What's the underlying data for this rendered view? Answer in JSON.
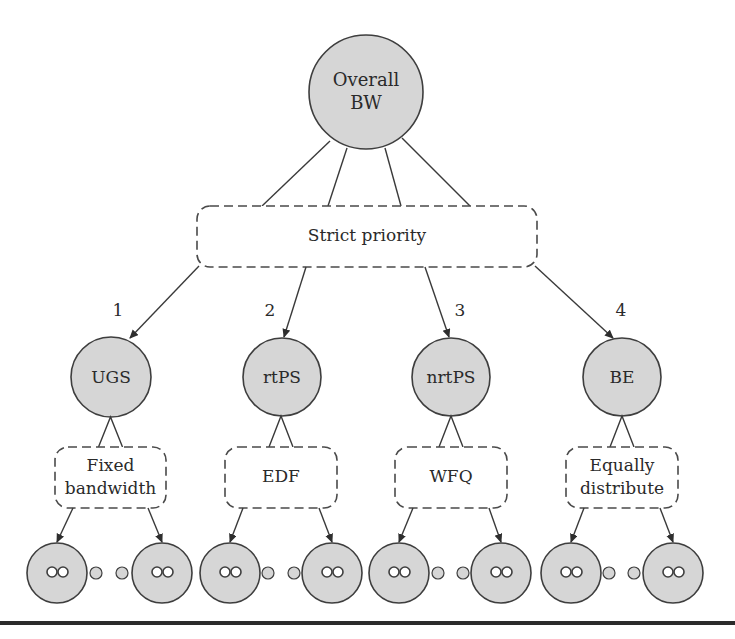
{
  "diagram": {
    "root": {
      "label_line1": "Overall",
      "label_line2": "BW",
      "cx": 366,
      "cy": 92,
      "r": 57
    },
    "scheduler": {
      "label": "Strict priority",
      "x": 197,
      "y": 206,
      "w": 340,
      "h": 61
    },
    "root_links": [
      {
        "x1": 330,
        "y1": 141,
        "x2": 262,
        "y2": 206
      },
      {
        "x1": 347,
        "y1": 148,
        "x2": 328,
        "y2": 206
      },
      {
        "x1": 385,
        "y1": 148,
        "x2": 401,
        "y2": 206
      },
      {
        "x1": 402,
        "y1": 138,
        "x2": 470,
        "y2": 206
      }
    ],
    "classes": [
      {
        "name": "UGS",
        "priority": "1",
        "cx": 111,
        "cy": 377,
        "r": 40,
        "priority_pos": {
          "x": 118,
          "y": 311
        },
        "arrow": {
          "x1": 199,
          "y1": 266,
          "x2": 130,
          "y2": 338
        },
        "policy": {
          "line1": "Fixed",
          "line2": "bandwidth",
          "x": 55,
          "y": 447,
          "w": 111,
          "h": 61
        },
        "leaves": [
          {
            "cx": 57,
            "cy": 573
          },
          {
            "cx": 162,
            "cy": 573
          }
        ],
        "dots": [
          {
            "cx": 96
          },
          {
            "cx": 122
          }
        ]
      },
      {
        "name": "rtPS",
        "priority": "2",
        "cx": 282,
        "cy": 377,
        "r": 39,
        "priority_pos": {
          "x": 270,
          "y": 311
        },
        "arrow": {
          "x1": 306,
          "y1": 267,
          "x2": 284,
          "y2": 337
        },
        "policy": {
          "line1": "EDF",
          "line2": "",
          "x": 225,
          "y": 447,
          "w": 112,
          "h": 61
        },
        "leaves": [
          {
            "cx": 230,
            "cy": 573
          },
          {
            "cx": 332,
            "cy": 573
          }
        ],
        "dots": [
          {
            "cx": 268
          },
          {
            "cx": 294
          }
        ]
      },
      {
        "name": "nrtPS",
        "priority": "3",
        "cx": 451,
        "cy": 377,
        "r": 39,
        "priority_pos": {
          "x": 460,
          "y": 311
        },
        "arrow": {
          "x1": 425,
          "y1": 267,
          "x2": 449,
          "y2": 337
        },
        "policy": {
          "line1": "WFQ",
          "line2": "",
          "x": 395,
          "y": 447,
          "w": 112,
          "h": 61
        },
        "leaves": [
          {
            "cx": 399,
            "cy": 573
          },
          {
            "cx": 501,
            "cy": 573
          }
        ],
        "dots": [
          {
            "cx": 438
          },
          {
            "cx": 463
          }
        ]
      },
      {
        "name": "BE",
        "priority": "4",
        "cx": 622,
        "cy": 377,
        "r": 39,
        "priority_pos": {
          "x": 621,
          "y": 311
        },
        "arrow": {
          "x1": 535,
          "y1": 266,
          "x2": 613,
          "y2": 338
        },
        "policy": {
          "line1": "Equally",
          "line2": "distribute",
          "x": 566,
          "y": 447,
          "w": 112,
          "h": 61
        },
        "leaves": [
          {
            "cx": 571,
            "cy": 573
          },
          {
            "cx": 673,
            "cy": 573
          }
        ],
        "dots": [
          {
            "cx": 609
          },
          {
            "cx": 634
          }
        ]
      }
    ],
    "leaf_radius": 30,
    "dot_radius": 6,
    "colors": {
      "node_fill": "#d6d6d6",
      "stroke": "#3e3e3e",
      "rule": "#2b2b2b"
    }
  }
}
